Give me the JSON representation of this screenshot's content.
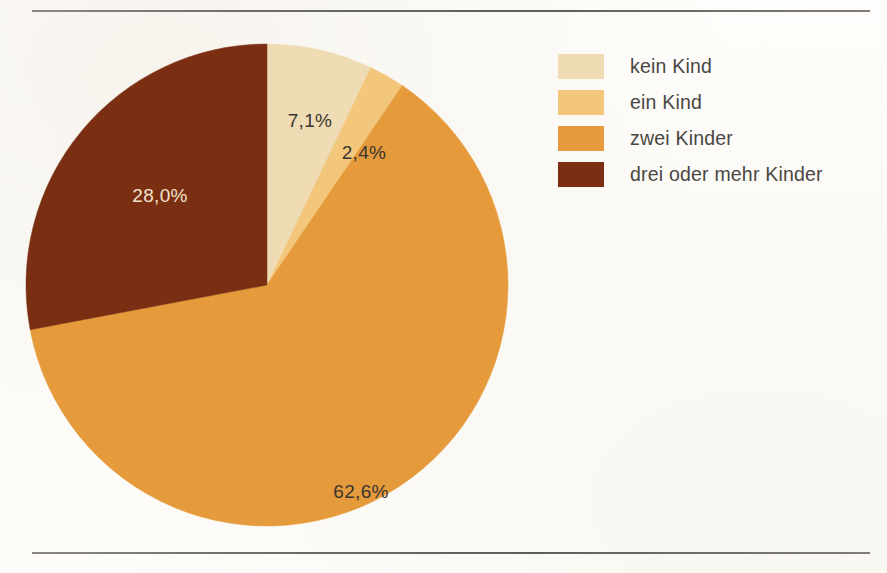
{
  "chart_data": {
    "type": "pie",
    "title": "",
    "subtitle": "",
    "xlabel": "",
    "ylabel": "",
    "legend_position": "right",
    "grid": false,
    "start_angle_deg": 0,
    "direction": "clockwise",
    "categories": [
      "kein Kind",
      "ein Kind",
      "zwei Kinder",
      "drei oder mehr Kinder"
    ],
    "values": [
      7.1,
      2.4,
      62.6,
      28.0
    ],
    "value_labels": [
      "7,1%",
      "2,4%",
      "62,6%",
      "28,0%"
    ],
    "colors": [
      "#eedcb4",
      "#f0c375",
      "#e89b३8",
      "#7c2e12"
    ],
    "slices": [
      {
        "label": "kein Kind",
        "value": 7.1,
        "value_label": "7,1%",
        "color": "#efdcb5",
        "label_color": "#3b3631",
        "label_x": 286,
        "label_y": 80
      },
      {
        "label": "ein Kind",
        "value": 2.4,
        "value_label": "2,4%",
        "color": "#f2c77c",
        "label_color": "#3b3631",
        "label_x": 340,
        "label_y": 112
      },
      {
        "label": "zwei Kinder",
        "value": 62.6,
        "value_label": "62,6%",
        "color": "#e59a3b",
        "label_color": "#3b3631",
        "label_x": 337,
        "label_y": 451
      },
      {
        "label": "drei oder mehr Kinder",
        "value": 28.0,
        "value_label": "28,0%",
        "color": "#7a2e12",
        "label_color": "#f1e3cb",
        "label_x": 136,
        "label_y": 155
      }
    ]
  },
  "legend": {
    "items": [
      {
        "label": "kein Kind",
        "color": "#efdcb5"
      },
      {
        "label": "ein Kind",
        "color": "#f2c77c"
      },
      {
        "label": "zwei Kinder",
        "color": "#e59a3b"
      },
      {
        "label": "drei oder mehr Kinder",
        "color": "#7a2e12"
      }
    ]
  },
  "geometry": {
    "center_x": 243,
    "center_y": 243,
    "radius": 241
  }
}
